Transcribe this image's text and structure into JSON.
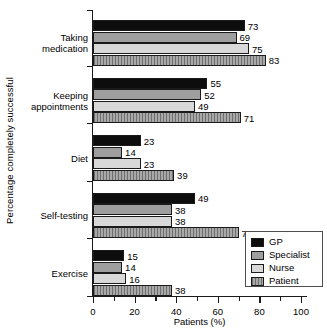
{
  "chart_data": {
    "type": "bar",
    "orientation": "horizontal",
    "title": "",
    "xlabel": "Patients (%)",
    "ylabel": "Percentage completely successful",
    "xlim": [
      0,
      100
    ],
    "xticks": [
      0,
      20,
      40,
      60,
      80,
      100
    ],
    "xminor_ticks": [
      10,
      30,
      50,
      70,
      90
    ],
    "grid": false,
    "legend_position": "bottom-right",
    "categories": [
      "Taking medication",
      "Keeping appointments",
      "Diet",
      "Self-testing",
      "Exercise"
    ],
    "category_lines": [
      [
        "Taking",
        "medication"
      ],
      [
        "Keeping",
        "appointments"
      ],
      [
        "Diet"
      ],
      [
        "Self-testing"
      ],
      [
        "Exercise"
      ]
    ],
    "series": [
      {
        "name": "GP",
        "color": "#0d0d0d",
        "values": [
          73,
          55,
          23,
          49,
          15
        ]
      },
      {
        "name": "Specialist",
        "color": "#9e9e9e",
        "values": [
          69,
          52,
          14,
          38,
          14
        ]
      },
      {
        "name": "Nurse",
        "color": "#d8d8d8",
        "values": [
          75,
          49,
          23,
          38,
          16
        ]
      },
      {
        "name": "Patient",
        "color": "#8f8f8f",
        "values": [
          83,
          71,
          39,
          70,
          38
        ]
      }
    ]
  },
  "axis": {
    "xtick_labels": [
      "0",
      "20",
      "40",
      "60",
      "80",
      "100"
    ],
    "x_title": "Patients (%)",
    "y_title": "Percentage completely successful"
  },
  "legend": {
    "items": [
      {
        "label": "GP",
        "swatch": "gp"
      },
      {
        "label": "Specialist",
        "swatch": "specialist"
      },
      {
        "label": "Nurse",
        "swatch": "nurse"
      },
      {
        "label": "Patient",
        "swatch": "patient"
      }
    ]
  }
}
